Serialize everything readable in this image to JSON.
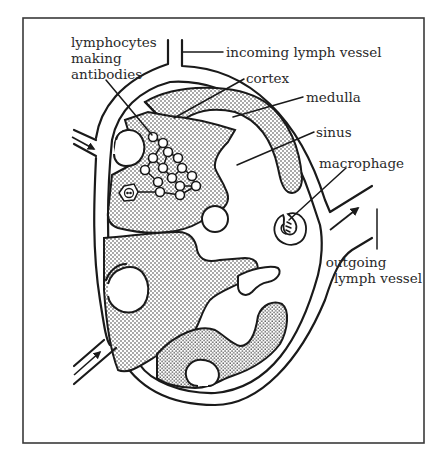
{
  "figure": {
    "colors": {
      "line": "#1a1a1a",
      "frame": "#3a3a3a",
      "background": "#ffffff",
      "stipple": "#2a2a2a",
      "label": "#2a2a2a"
    }
  },
  "labels": {
    "lymphocytes_line1": "lymphocytes",
    "lymphocytes_line2": "making",
    "lymphocytes_line3": "antibodies",
    "incoming": "incoming lymph vessel",
    "cortex": "cortex",
    "medulla": "medulla",
    "sinus": "sinus",
    "macrophage": "macrophage",
    "outgoing_line1": "outgoing",
    "outgoing_line2": "lymph vessel"
  }
}
